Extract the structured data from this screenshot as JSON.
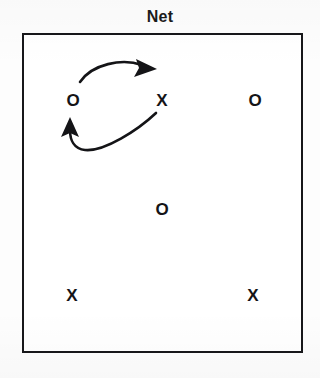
{
  "diagram": {
    "title": "Net",
    "type": "volleyball-rotation-play-diagram",
    "court": {
      "shape": "rectangle",
      "border_color": "#17171a",
      "fill_color": "#ffffff"
    },
    "background_color": "#fdfdfd",
    "ink_color": "#141417",
    "players": [
      {
        "id": "p1",
        "label": "O",
        "team": "o",
        "x": 73,
        "y": 100,
        "row": "front",
        "position": "front-left"
      },
      {
        "id": "p2",
        "label": "X",
        "team": "x",
        "x": 162,
        "y": 100,
        "row": "front",
        "position": "front-center"
      },
      {
        "id": "p3",
        "label": "O",
        "team": "o",
        "x": 255,
        "y": 100,
        "row": "front",
        "position": "front-right"
      },
      {
        "id": "p4",
        "label": "O",
        "team": "o",
        "x": 162,
        "y": 209,
        "row": "middle",
        "position": "middle-center"
      },
      {
        "id": "p5",
        "label": "X",
        "team": "x",
        "x": 72,
        "y": 295,
        "row": "back",
        "position": "back-left"
      },
      {
        "id": "p6",
        "label": "X",
        "team": "x",
        "x": 253,
        "y": 295,
        "row": "back",
        "position": "back-right"
      }
    ],
    "arrows": [
      {
        "id": "arrow-switch-right",
        "meaning": "front-left-player-moves-to-front-center",
        "from_player": "p1",
        "to_player": "p2",
        "direction": "left-to-right",
        "style": "curved-solid",
        "head": "filled-triangle"
      },
      {
        "id": "arrow-switch-left",
        "meaning": "front-center-player-moves-to-front-left",
        "from_player": "p2",
        "to_player": "p1",
        "direction": "right-to-left",
        "style": "curved-solid",
        "head": "filled-triangle"
      }
    ]
  }
}
